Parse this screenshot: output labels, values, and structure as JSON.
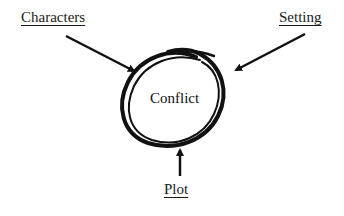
{
  "diagram": {
    "center": {
      "label": "Conflict"
    },
    "nodes": [
      {
        "id": "characters",
        "label": "Characters",
        "position": "top-left"
      },
      {
        "id": "setting",
        "label": "Setting",
        "position": "top-right"
      },
      {
        "id": "plot",
        "label": "Plot",
        "position": "bottom"
      }
    ],
    "edges": [
      {
        "from": "characters",
        "to": "conflict"
      },
      {
        "from": "setting",
        "to": "conflict"
      },
      {
        "from": "plot",
        "to": "conflict"
      }
    ],
    "colors": {
      "ink": "#111111",
      "background": "#ffffff"
    }
  }
}
